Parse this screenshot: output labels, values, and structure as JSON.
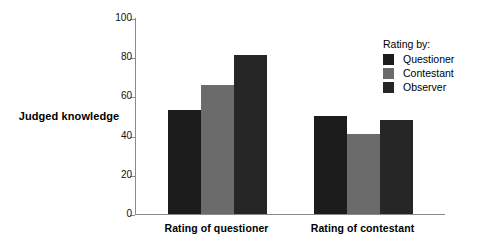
{
  "chart_data": {
    "type": "bar",
    "title": "",
    "xlabel": "",
    "ylabel": "Judged knowledge",
    "categories": [
      "Rating of questioner",
      "Rating of contestant"
    ],
    "series": [
      {
        "name": "Questioner",
        "values": [
          53,
          50
        ],
        "color": "#1c1c1c"
      },
      {
        "name": "Contestant",
        "values": [
          66,
          41
        ],
        "color": "#6b6b6b"
      },
      {
        "name": "Observer",
        "values": [
          81,
          48
        ],
        "color": "#262626"
      }
    ],
    "ylim": [
      0,
      100
    ],
    "yticks": [
      0,
      20,
      40,
      60,
      80,
      100
    ],
    "ytick_labels": [
      "0",
      "20",
      "40",
      "60",
      "80",
      "100"
    ],
    "grid": false,
    "legend": {
      "title": "Rating by:",
      "position": "upper-right",
      "entries": [
        "Questioner",
        "Contestant",
        "Observer"
      ]
    },
    "axis_color": "#8a8a8a",
    "background": "#ffffff"
  }
}
